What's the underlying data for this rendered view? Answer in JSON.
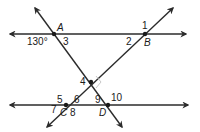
{
  "diagram": {
    "title": "",
    "colors": {
      "line": "#2b2b2b",
      "right_angle_marker": "#c8c8c8",
      "text": "#1a1a1a"
    },
    "points": [
      {
        "name": "A",
        "x": 54,
        "y": 34
      },
      {
        "name": "B",
        "x": 145,
        "y": 34
      },
      {
        "name": "C",
        "x": 66,
        "y": 105
      },
      {
        "name": "D",
        "x": 108,
        "y": 105
      },
      {
        "name": "intersection",
        "x": 91,
        "y": 82
      }
    ],
    "given_angle": "130°",
    "angle_labels": {
      "a1": "1",
      "a2": "2",
      "a3": "3",
      "a4": "4",
      "a5": "5",
      "a6": "6",
      "a7": "7",
      "a8": "8",
      "a9": "9",
      "a10": "10"
    },
    "point_labels": {
      "A": "A",
      "B": "B",
      "C": "C",
      "D": "D"
    },
    "right_angle_at": "intersection"
  }
}
